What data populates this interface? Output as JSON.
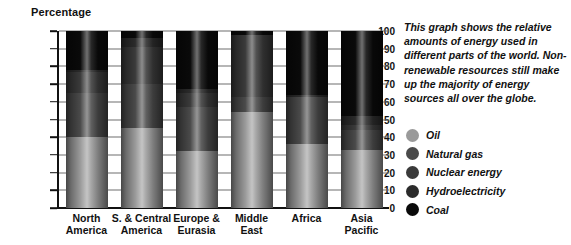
{
  "chart_data": {
    "type": "bar",
    "subtype": "stacked-bar-100-percent",
    "title": "",
    "ylabel": "Percentage",
    "xlabel": "",
    "ylim": [
      0,
      100
    ],
    "yticks": [
      0,
      10,
      20,
      30,
      40,
      50,
      60,
      70,
      80,
      90,
      100
    ],
    "grid": true,
    "legend_position": "right",
    "categories": [
      "North America",
      "S. & Central America",
      "Europe & Eurasia",
      "Middle East",
      "Africa",
      "Asia Pacific"
    ],
    "series": [
      {
        "name": "Oil",
        "color": "#9a9a9a",
        "values": [
          40,
          45,
          32,
          54,
          36,
          33
        ]
      },
      {
        "name": "Natural gas",
        "color": "#4a4a4a",
        "values": [
          25,
          25,
          25,
          9,
          27,
          11
        ]
      },
      {
        "name": "Nuclear energy",
        "color": "#3a3a3a",
        "values": [
          12,
          21,
          8,
          35,
          0,
          3
        ]
      },
      {
        "name": "Hydroelectricity",
        "color": "#2b2b2b",
        "values": [
          1,
          5,
          2,
          0,
          1,
          5
        ]
      },
      {
        "name": "Coal",
        "color": "#0a0a0a",
        "values": [
          22,
          4,
          33,
          2,
          36,
          48
        ]
      }
    ],
    "bar_tops": [
      100,
      96,
      100,
      100,
      100,
      100
    ],
    "annotations": [
      "This graph shows the relative amounts of energy used in different parts of the world. Non-renewable resources still make up the majority of energy sources all over the globe."
    ]
  },
  "axis": {
    "y_title": "Percentage"
  },
  "description": {
    "text": "This graph shows the relative amounts of energy used in different parts of the world. Non-renewable resources still make up the majority of energy sources all over the globe."
  },
  "legend": {
    "items": [
      {
        "label": "Oil",
        "color": "#9a9a9a"
      },
      {
        "label": "Natural gas",
        "color": "#4a4a4a"
      },
      {
        "label": "Nuclear energy",
        "color": "#3a3a3a"
      },
      {
        "label": "Hydroelectricity",
        "color": "#2b2b2b"
      },
      {
        "label": "Coal",
        "color": "#0a0a0a"
      }
    ]
  }
}
